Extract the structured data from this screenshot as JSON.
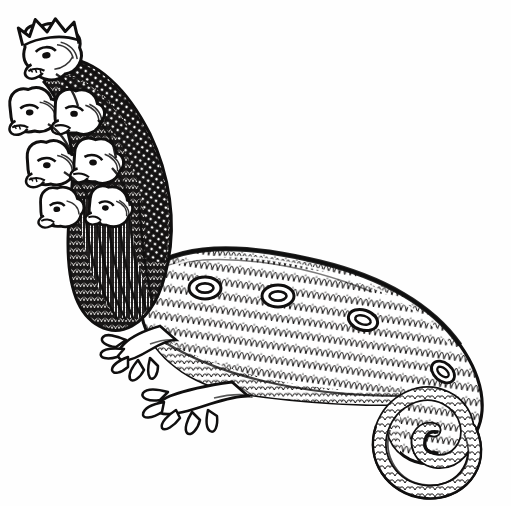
{
  "page": {
    "title": "MONSTER",
    "background_color": "#fefefe",
    "ink_color": "#100f0f",
    "width": 511,
    "height": 506
  },
  "illustration": {
    "name": "seven-headed-scaly-monster",
    "style": "woodcut engraving, black line art on white",
    "subject": "Multi-headed hydra-like beast with scaled body, clawed forelimbs and a coiled spiral tail",
    "orientation": "heads at upper-left, body sweeping right, tail spiral at lower-right",
    "heads": {
      "count": 7,
      "crowned_head_index": 0,
      "description": "stacked snarling beast heads with open mouths along an arched neck; topmost wears a pointed crown"
    },
    "body": {
      "texture": "imbricated scales",
      "ring_spots": 4,
      "ring_spot_positions": [
        {
          "x": 205,
          "y": 288
        },
        {
          "x": 278,
          "y": 296
        },
        {
          "x": 363,
          "y": 320
        },
        {
          "x": 443,
          "y": 372
        }
      ]
    },
    "limbs": {
      "count": 2,
      "type": "clawed forefeet",
      "claws_per_foot": 5
    },
    "tail": {
      "shape": "inward spiral coil",
      "center": {
        "x": 450,
        "y": 452
      },
      "turns": 2.2
    }
  }
}
